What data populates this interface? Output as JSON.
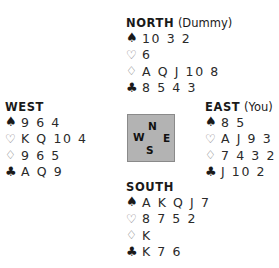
{
  "hands": {
    "north": {
      "name": "NORTH",
      "role": "(Dummy)",
      "spades": "10 3 2",
      "hearts": "6",
      "diamonds": "A Q J 10 8",
      "clubs": "8 5 4 3"
    },
    "west": {
      "name": "WEST",
      "role": "",
      "spades": "9 6 4",
      "hearts": "K Q 10 4",
      "diamonds": "9 6 5",
      "clubs": "A Q 9"
    },
    "east": {
      "name": "EAST",
      "role": "(You)",
      "spades": "8 5",
      "hearts": "A J 9 3",
      "diamonds": "7 4 3 2",
      "clubs": "J 10 2"
    },
    "south": {
      "name": "SOUTH",
      "role": "",
      "spades": "A K Q J 7",
      "hearts": "8 7 5 2",
      "diamonds": "K",
      "clubs": "K 7 6"
    }
  },
  "suits": {
    "spades": "♠",
    "hearts": "♡",
    "diamonds": "♢",
    "clubs": "♣"
  },
  "compass": {
    "n": "N",
    "w": "W",
    "e": "E",
    "s": "S"
  },
  "colors": {
    "compass_fill": "#b3b3b3",
    "compass_border": "#8a8a8a",
    "text": "#1a1a1a",
    "outline_suit": "#777777"
  }
}
